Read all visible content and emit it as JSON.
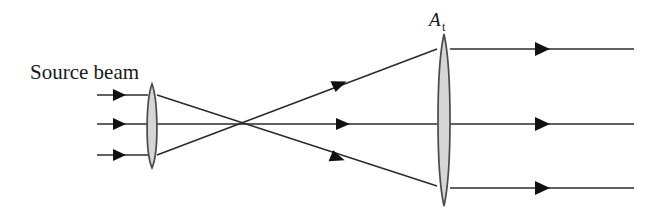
{
  "figure": {
    "name": "beam-expander-optical-diagram",
    "width": 664,
    "height": 216,
    "background_color": "#ffffff",
    "stroke_color": "#2b2b2b",
    "arrow_color": "#111111",
    "lens_fill_color": "#d6d6d6",
    "lens_stroke_color": "#4a4a4a"
  },
  "labels": {
    "source_beam": "Source beam",
    "lens_label_main": "A",
    "lens_label_sub": "t",
    "lens_label_full": "A_t"
  },
  "optics": {
    "input_lens": {
      "name": "small-collimating-lens",
      "center_x": 152,
      "center_y": 126,
      "half_width": 7,
      "half_height": 42
    },
    "output_lens": {
      "name": "large-telescope-lens",
      "label": "A_t",
      "center_x": 444,
      "center_y": 120,
      "half_width": 8,
      "half_height": 86
    },
    "focal_point": {
      "x": 232,
      "y": 124
    },
    "input_rays": [
      {
        "name": "input-ray-top",
        "x1": 97,
        "y1": 95,
        "x2": 146,
        "y2": 95,
        "arrow_x": 122,
        "arrow_y": 95
      },
      {
        "name": "input-ray-middle",
        "x1": 97,
        "y1": 124,
        "x2": 146,
        "y2": 124,
        "arrow_x": 122,
        "arrow_y": 124
      },
      {
        "name": "input-ray-bottom",
        "x1": 97,
        "y1": 155,
        "x2": 146,
        "y2": 155,
        "arrow_x": 122,
        "arrow_y": 155
      }
    ],
    "crossing_rays": [
      {
        "name": "crossing-ray-upper-to-lower",
        "x1": 158,
        "y1": 95,
        "x2": 436,
        "y2": 186,
        "arrow_x": 343,
        "arrow_y": 157,
        "arrow_angle": 18
      },
      {
        "name": "crossing-ray-axis",
        "x1": 158,
        "y1": 124,
        "x2": 436,
        "y2": 124,
        "arrow_x": 348,
        "arrow_y": 124,
        "arrow_angle": 0
      },
      {
        "name": "crossing-ray-lower-to-upper",
        "x1": 158,
        "y1": 155,
        "x2": 436,
        "y2": 49,
        "arrow_x": 345,
        "arrow_y": 84,
        "arrow_angle": -21
      }
    ],
    "output_rays": [
      {
        "name": "output-ray-top",
        "x1": 452,
        "y1": 49,
        "x2": 634,
        "y2": 49,
        "arrow_x": 548,
        "arrow_y": 49
      },
      {
        "name": "output-ray-middle",
        "x1": 452,
        "y1": 124,
        "x2": 634,
        "y2": 124,
        "arrow_x": 548,
        "arrow_y": 124
      },
      {
        "name": "output-ray-bottom",
        "x1": 452,
        "y1": 188,
        "x2": 634,
        "y2": 188,
        "arrow_x": 548,
        "arrow_y": 188
      }
    ]
  }
}
